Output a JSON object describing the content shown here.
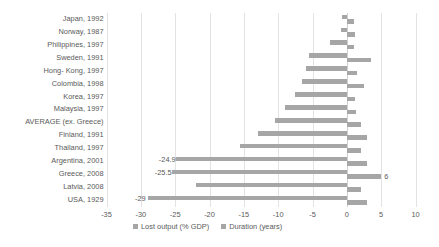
{
  "chart_data": {
    "type": "bar",
    "title": "",
    "subtitle": "",
    "xlabel": "",
    "ylabel": "",
    "orientation": "horizontal",
    "grid": true,
    "legend_position": "bottom",
    "xlim": [
      -35,
      10
    ],
    "xticks": [
      "-35",
      "-30",
      "-25",
      "-20",
      "-15",
      "-10",
      "-5",
      "0",
      "5",
      "10"
    ],
    "xtick_values": [
      -35,
      -30,
      -25,
      -20,
      -15,
      -10,
      -5,
      0,
      5,
      10
    ],
    "categories": [
      "Japan, 1992",
      "Norway, 1987",
      "Philippines, 1997",
      "Sweden, 1991",
      "Hong- Kong, 1997",
      "Colombia, 1998",
      "Korea, 1997",
      "Malaysia, 1997",
      "AVERAGE (ex. Greece)",
      "Finland, 1991",
      "Thailand, 1997",
      "Argentina, 2001",
      "Greece, 2008",
      "Latvia, 2008",
      "USA, 1929"
    ],
    "series": [
      {
        "name": "Lost output (% GDP)",
        "color": "#a6a6a6",
        "values": [
          -0.7,
          -0.8,
          -2.5,
          -5.5,
          -6.0,
          -6.5,
          -7.5,
          -9.0,
          -10.5,
          -13.0,
          -15.5,
          -24.9,
          -25.5,
          -22.0,
          -29.0
        ]
      },
      {
        "name": "Duration (years)",
        "color": "#a6a6a6",
        "values": [
          1.0,
          1.2,
          1.0,
          3.5,
          1.5,
          2.5,
          1.2,
          1.3,
          2.0,
          3.0,
          2.0,
          3.0,
          5.0,
          2.0,
          3.0
        ]
      }
    ],
    "data_labels": [
      {
        "category": "Argentina, 2001",
        "text": "-24.9",
        "series": "Lost output (% GDP)"
      },
      {
        "category": "Greece, 2008",
        "text": "-25.5",
        "series": "Lost output (% GDP)"
      },
      {
        "category": "Greece, 2008",
        "text": "6",
        "series": "Duration (years)"
      },
      {
        "category": "USA, 1929",
        "text": "-29",
        "series": "Lost output (% GDP)"
      }
    ],
    "legend": [
      {
        "label": "Lost output (% GDP)",
        "color": "#a6a6a6"
      },
      {
        "label": "Duration (years)",
        "color": "#a6a6a6"
      }
    ]
  }
}
